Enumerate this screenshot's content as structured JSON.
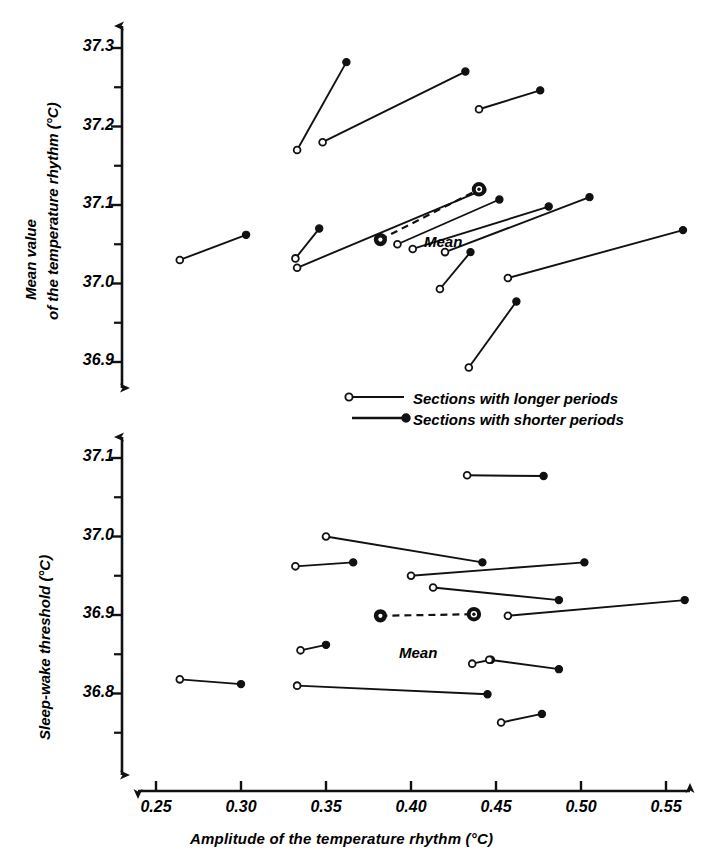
{
  "figure": {
    "xlabel": "Amplitude of the temperature rhythm (°C)",
    "xticks": [
      "0.25",
      "0.30",
      "0.35",
      "0.40",
      "0.45",
      "0.50",
      "0.55"
    ],
    "mean_label": "Mean",
    "legend": [
      {
        "marker": "open-circle",
        "label": "Sections with longer periods"
      },
      {
        "marker": "filled-circle",
        "label": "Sections with shorter periods"
      }
    ]
  },
  "panel_top": {
    "ylabel_line1": "Mean value",
    "ylabel_line2": "of the temperature rhythm (°C)",
    "yticks": [
      "37.3",
      "37.2",
      "37.1",
      "37.0",
      "36.9"
    ]
  },
  "panel_bottom": {
    "ylabel": "Sleep-wake threshold (°C)",
    "yticks": [
      "37.1",
      "37.0",
      "36.9",
      "36.8"
    ]
  },
  "chart_data": [
    {
      "type": "line",
      "panel": "top",
      "title": "Mean value of the temperature rhythm vs amplitude",
      "xlabel": "Amplitude of the temperature rhythm (°C)",
      "ylabel": "Mean value of the temperature rhythm (°C)",
      "xlim": [
        0.235,
        0.565
      ],
      "ylim": [
        36.865,
        37.33
      ],
      "grid": false,
      "legend_position": "bottom-center",
      "series_note": "Each segment joins one subject's longer-period section (open circle) to the shorter-period section (filled circle).",
      "segments": [
        {
          "open": [
            0.264,
            37.03
          ],
          "filled": [
            0.303,
            37.062
          ]
        },
        {
          "open": [
            0.333,
            37.17
          ],
          "filled": [
            0.362,
            37.282
          ]
        },
        {
          "open": [
            0.348,
            37.18
          ],
          "filled": [
            0.432,
            37.27
          ]
        },
        {
          "open": [
            0.44,
            37.222
          ],
          "filled": [
            0.476,
            37.246
          ]
        },
        {
          "open": [
            0.332,
            37.032
          ],
          "filled": [
            0.346,
            37.07
          ]
        },
        {
          "open": [
            0.333,
            37.02
          ],
          "filled": [
            0.442,
            37.119
          ]
        },
        {
          "open": [
            0.392,
            37.05
          ],
          "filled": [
            0.452,
            37.107
          ]
        },
        {
          "open": [
            0.401,
            37.044
          ],
          "filled": [
            0.481,
            37.098
          ]
        },
        {
          "open": [
            0.42,
            37.04
          ],
          "filled": [
            0.505,
            37.11
          ]
        },
        {
          "open": [
            0.417,
            36.993
          ],
          "filled": [
            0.435,
            37.04
          ]
        },
        {
          "open": [
            0.457,
            37.007
          ],
          "filled": [
            0.56,
            37.068
          ]
        },
        {
          "open": [
            0.434,
            36.893
          ],
          "filled": [
            0.462,
            36.977
          ]
        }
      ],
      "mean_segment": {
        "open": [
          0.382,
          37.056
        ],
        "filled": [
          0.44,
          37.12
        ],
        "label": "Mean",
        "style": "dashed"
      }
    },
    {
      "type": "line",
      "panel": "bottom",
      "title": "Sleep-wake threshold vs amplitude",
      "xlabel": "Amplitude of the temperature rhythm (°C)",
      "ylabel": "Sleep-wake threshold (°C)",
      "xlim": [
        0.235,
        0.565
      ],
      "ylim": [
        36.735,
        37.13
      ],
      "grid": false,
      "legend_position": "bottom-center",
      "series_note": "Each segment joins one subject's longer-period section (open circle) to the shorter-period section (filled circle).",
      "segments": [
        {
          "open": [
            0.433,
            37.078
          ],
          "filled": [
            0.478,
            37.077
          ]
        },
        {
          "open": [
            0.35,
            37.0
          ],
          "filled": [
            0.442,
            36.967
          ]
        },
        {
          "open": [
            0.332,
            36.962
          ],
          "filled": [
            0.366,
            36.967
          ]
        },
        {
          "open": [
            0.4,
            36.95
          ],
          "filled": [
            0.502,
            36.967
          ]
        },
        {
          "open": [
            0.413,
            36.935
          ],
          "filled": [
            0.487,
            36.919
          ]
        },
        {
          "open": [
            0.457,
            36.899
          ],
          "filled": [
            0.561,
            36.919
          ]
        },
        {
          "open": [
            0.335,
            36.855
          ],
          "filled": [
            0.35,
            36.862
          ]
        },
        {
          "open": [
            0.436,
            36.838
          ],
          "filled": [
            0.447,
            36.843
          ]
        },
        {
          "open": [
            0.446,
            36.843
          ],
          "filled": [
            0.487,
            36.831
          ]
        },
        {
          "open": [
            0.264,
            36.818
          ],
          "filled": [
            0.3,
            36.812
          ]
        },
        {
          "open": [
            0.333,
            36.81
          ],
          "filled": [
            0.445,
            36.799
          ]
        },
        {
          "open": [
            0.453,
            36.763
          ],
          "filled": [
            0.477,
            36.774
          ]
        }
      ],
      "mean_segment": {
        "open": [
          0.382,
          36.899
        ],
        "filled": [
          0.437,
          36.901
        ],
        "label": "Mean",
        "style": "dashed"
      }
    }
  ]
}
